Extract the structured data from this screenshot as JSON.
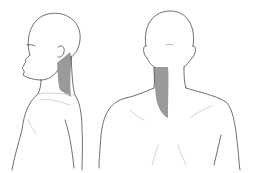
{
  "figure": {
    "description": "Anatomical illustration of neck pain referral area, lateral and posterior views",
    "views": [
      {
        "id": "lateral",
        "label": "Side view"
      },
      {
        "id": "posterior",
        "label": "Back view"
      }
    ],
    "colors": {
      "line": "#4a4a4a",
      "light_line": "#c8c8c8",
      "shaded_area": "#9a9a9a",
      "background": "#ffffff"
    }
  }
}
